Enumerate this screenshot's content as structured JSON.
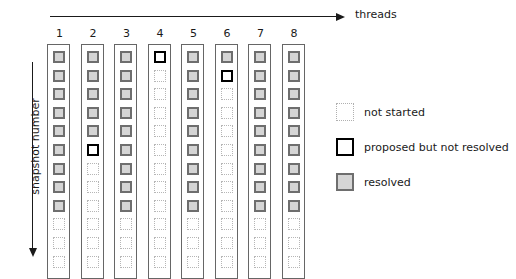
{
  "axes": {
    "x_label": "threads",
    "y_label": "snapshot number",
    "x_arrow_icon": "arrow-right-icon",
    "y_arrow_icon": "arrow-down-icon"
  },
  "chart_data": {
    "type": "heatmap",
    "title": "",
    "xlabel": "threads",
    "ylabel": "snapshot number",
    "grid": false,
    "legend_position": "right",
    "categories": [
      "1",
      "2",
      "3",
      "4",
      "5",
      "6",
      "7",
      "8"
    ],
    "rows": 12,
    "state_names": [
      "not started",
      "proposed but not resolved",
      "resolved"
    ],
    "state_keys": [
      "notstarted",
      "proposed",
      "resolved"
    ],
    "columns": [
      {
        "label": "1",
        "cells": [
          "resolved",
          "resolved",
          "resolved",
          "resolved",
          "resolved",
          "resolved",
          "resolved",
          "resolved",
          "resolved",
          "notstarted",
          "notstarted",
          "notstarted"
        ]
      },
      {
        "label": "2",
        "cells": [
          "resolved",
          "resolved",
          "resolved",
          "resolved",
          "resolved",
          "proposed",
          "notstarted",
          "notstarted",
          "notstarted",
          "notstarted",
          "notstarted",
          "notstarted"
        ]
      },
      {
        "label": "3",
        "cells": [
          "resolved",
          "resolved",
          "resolved",
          "resolved",
          "resolved",
          "resolved",
          "resolved",
          "resolved",
          "resolved",
          "notstarted",
          "notstarted",
          "notstarted"
        ]
      },
      {
        "label": "4",
        "cells": [
          "proposed",
          "notstarted",
          "notstarted",
          "notstarted",
          "notstarted",
          "notstarted",
          "notstarted",
          "notstarted",
          "notstarted",
          "notstarted",
          "notstarted",
          "notstarted"
        ]
      },
      {
        "label": "5",
        "cells": [
          "resolved",
          "resolved",
          "resolved",
          "resolved",
          "resolved",
          "resolved",
          "resolved",
          "resolved",
          "resolved",
          "notstarted",
          "notstarted",
          "notstarted"
        ]
      },
      {
        "label": "6",
        "cells": [
          "resolved",
          "proposed",
          "notstarted",
          "notstarted",
          "notstarted",
          "notstarted",
          "notstarted",
          "notstarted",
          "notstarted",
          "notstarted",
          "notstarted",
          "notstarted"
        ]
      },
      {
        "label": "7",
        "cells": [
          "resolved",
          "resolved",
          "resolved",
          "resolved",
          "resolved",
          "resolved",
          "resolved",
          "resolved",
          "resolved",
          "notstarted",
          "notstarted",
          "notstarted"
        ]
      },
      {
        "label": "8",
        "cells": [
          "resolved",
          "resolved",
          "resolved",
          "resolved",
          "resolved",
          "resolved",
          "resolved",
          "resolved",
          "resolved",
          "notstarted",
          "notstarted",
          "notstarted"
        ]
      }
    ],
    "colors": {
      "resolved_fill": "#d5d5d5",
      "resolved_border": "#6e6e6e",
      "proposed_border": "#000000",
      "notstarted_border": "#b6b6b6",
      "column_border": "#666666",
      "background": "#ffffff",
      "text": "#1a1a1a"
    }
  },
  "legend": {
    "items": [
      {
        "state": "notstarted",
        "label": "not started"
      },
      {
        "state": "proposed",
        "label": "proposed but not resolved"
      },
      {
        "state": "resolved",
        "label": "resolved"
      }
    ]
  }
}
